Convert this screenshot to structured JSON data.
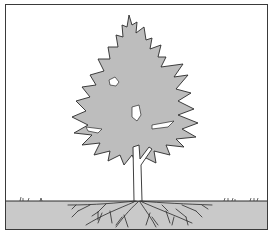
{
  "illustration": {
    "subject": "tree with root system",
    "colors": {
      "canopy": "#bdbdbd",
      "soil": "#c9c9c9",
      "sky": "#ffffff",
      "line": "#2a2a2a"
    }
  }
}
